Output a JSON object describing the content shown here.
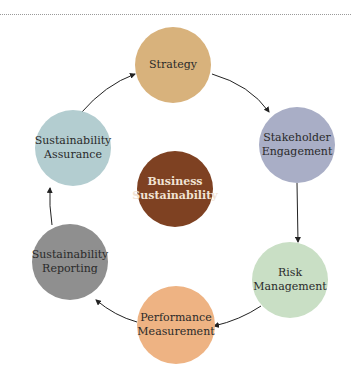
{
  "diagram": {
    "center": {
      "label_line1": "Business",
      "label_line2": "Sustainability",
      "color": "#7e4122"
    },
    "nodes": [
      {
        "id": "strategy",
        "label_line1": "Strategy",
        "label_line2": "",
        "color": "#d8b27c"
      },
      {
        "id": "stakeholder-engagement",
        "label_line1": "Stakeholder",
        "label_line2": "Engagement",
        "color": "#a9aec6"
      },
      {
        "id": "risk-management",
        "label_line1": "Risk",
        "label_line2": "Management",
        "color": "#c9dfc5"
      },
      {
        "id": "performance-measurement",
        "label_line1": "Performance",
        "label_line2": "Measurement",
        "color": "#eeb383"
      },
      {
        "id": "sustainability-reporting",
        "label_line1": "Sustainability",
        "label_line2": "Reporting",
        "color": "#8f8f8f"
      },
      {
        "id": "sustainability-assurance",
        "label_line1": "Sustainability",
        "label_line2": "Assurance",
        "color": "#b3cdd0"
      }
    ],
    "flow": [
      "Strategy",
      "Stakeholder Engagement",
      "Risk Management",
      "Performance Measurement",
      "Sustainability Reporting",
      "Sustainability Assurance",
      "Strategy"
    ]
  }
}
